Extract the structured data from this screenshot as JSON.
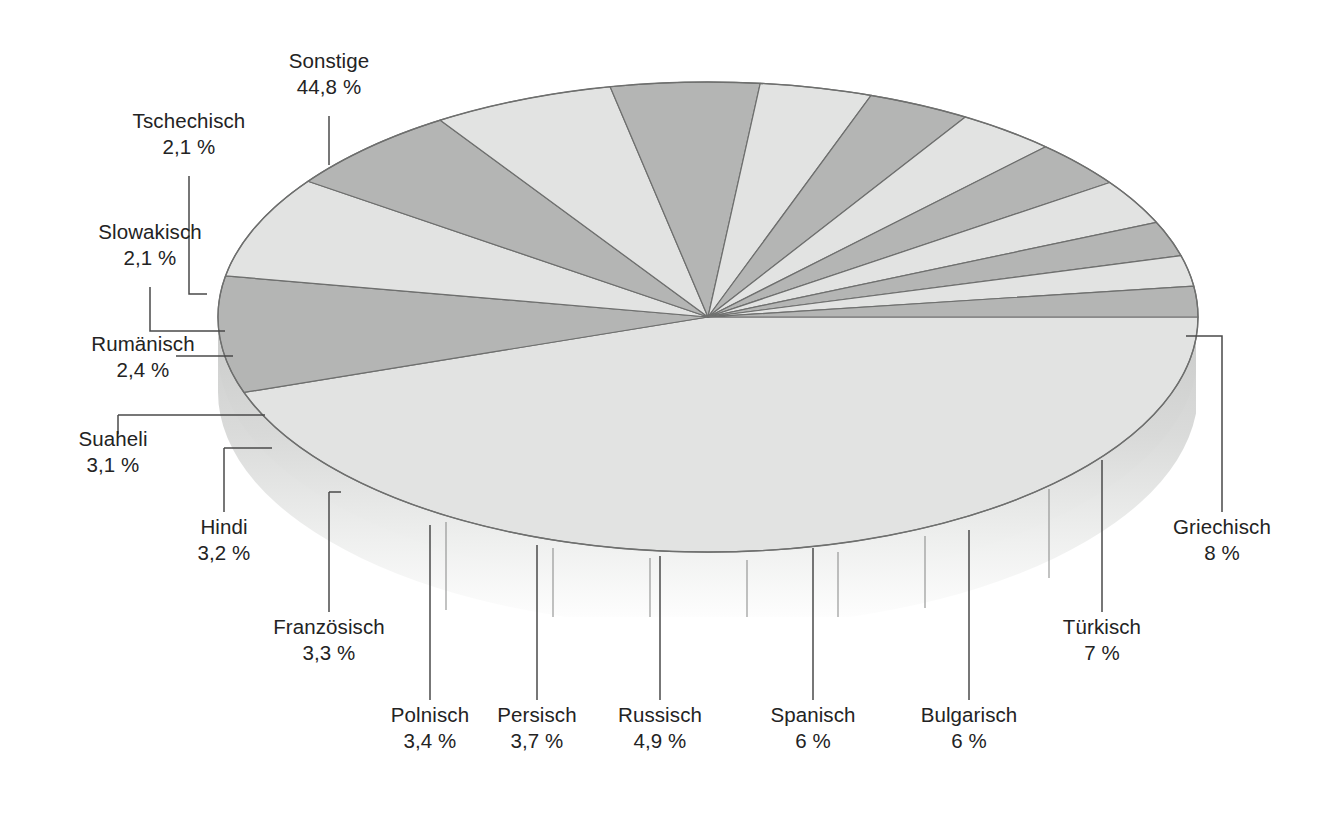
{
  "chart_data": {
    "type": "pie",
    "title": "",
    "subtitle": "",
    "xlabel": "",
    "ylabel": "",
    "legend_position": "callout-labels",
    "grid": false,
    "style": "3d-exploded-none",
    "value_unit": "%",
    "decimal_separator": ",",
    "total": 100,
    "categories": [
      "Sonstige",
      "Griechisch",
      "Türkisch",
      "Bulgarisch",
      "Spanisch",
      "Russisch",
      "Persisch",
      "Polnisch",
      "Französisch",
      "Hindi",
      "Suaheli",
      "Rumänisch",
      "Slowakisch",
      "Tschechisch"
    ],
    "values": [
      44.8,
      8,
      7,
      6,
      6,
      4.9,
      3.7,
      3.4,
      3.3,
      3.2,
      3.1,
      2.4,
      2.1,
      2.1
    ],
    "labels": [
      "44,8 %",
      "8 %",
      "7 %",
      "6 %",
      "6 %",
      "4,9 %",
      "3,7 %",
      "3,4 %",
      "3,3 %",
      "3,2 %",
      "3,1 %",
      "2,4 %",
      "2,1 %",
      "2,1 %"
    ],
    "slice_fills": [
      "#e2e3e2",
      "#b4b5b4",
      "#e2e3e2",
      "#b4b5b4",
      "#e2e3e2",
      "#b4b5b4",
      "#e2e3e2",
      "#b4b5b4",
      "#e2e3e2",
      "#b4b5b4",
      "#e2e3e2",
      "#b4b5b4",
      "#e2e3e2",
      "#b4b5b4"
    ]
  },
  "colors": {
    "slice_light": "#e2e3e2",
    "slice_dark": "#b4b5b4",
    "outline": "#6e6f6e",
    "side_wall_top": "#c9cac9",
    "side_wall_bottom": "#ffffff",
    "leader_line": "#4a4a4a",
    "text": "#232323",
    "background": "#ffffff"
  },
  "slices": [
    {
      "name": "Sonstige",
      "pct": "44,8 %",
      "value": 44.8
    },
    {
      "name": "Griechisch",
      "pct": "8 %",
      "value": 8
    },
    {
      "name": "Türkisch",
      "pct": "7 %",
      "value": 7
    },
    {
      "name": "Bulgarisch",
      "pct": "6 %",
      "value": 6
    },
    {
      "name": "Spanisch",
      "pct": "6 %",
      "value": 6
    },
    {
      "name": "Russisch",
      "pct": "4,9 %",
      "value": 4.9
    },
    {
      "name": "Persisch",
      "pct": "3,7 %",
      "value": 3.7
    },
    {
      "name": "Polnisch",
      "pct": "3,4 %",
      "value": 3.4
    },
    {
      "name": "Französisch",
      "pct": "3,3 %",
      "value": 3.3
    },
    {
      "name": "Hindi",
      "pct": "3,2 %",
      "value": 3.2
    },
    {
      "name": "Suaheli",
      "pct": "3,1 %",
      "value": 3.1
    },
    {
      "name": "Rumänisch",
      "pct": "2,4 %",
      "value": 2.4
    },
    {
      "name": "Slowakisch",
      "pct": "2,1 %",
      "value": 2.1
    },
    {
      "name": "Tschechisch",
      "pct": "2,1 %",
      "value": 2.1
    }
  ]
}
